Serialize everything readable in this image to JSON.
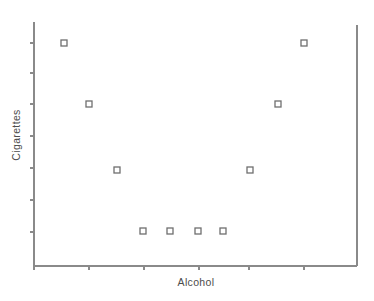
{
  "chart_data": {
    "type": "scatter",
    "title": "",
    "xlabel": "Alcohol",
    "ylabel": "Cigarettes",
    "grid": false,
    "legend": null,
    "xlim": [
      0,
      7
    ],
    "ylim": [
      0,
      7
    ],
    "x_tick_labels": [
      "",
      "",
      "",
      "",
      "",
      ""
    ],
    "y_tick_labels": [
      "",
      "",
      "",
      "",
      "",
      "",
      ""
    ],
    "x_tick_positions": [
      34,
      89,
      144,
      199,
      249,
      304
    ],
    "y_tick_positions": [
      43,
      73,
      104,
      136,
      168,
      200,
      232
    ],
    "marker": "open-square",
    "marker_size": 6,
    "marker_color": "#6f6f6f",
    "axis_color": "#8a8a8a",
    "text_color": "#4c4c4c",
    "points": [
      {
        "label": "p1",
        "px": 64,
        "py": 43
      },
      {
        "label": "p2",
        "px": 89,
        "py": 104
      },
      {
        "label": "p3",
        "px": 117,
        "py": 170
      },
      {
        "label": "p4",
        "px": 143,
        "py": 231
      },
      {
        "label": "p5",
        "px": 170,
        "py": 231
      },
      {
        "label": "p6",
        "px": 198,
        "py": 231
      },
      {
        "label": "p7",
        "px": 223,
        "py": 231
      },
      {
        "label": "p8",
        "px": 250,
        "py": 170
      },
      {
        "label": "p9",
        "px": 278,
        "py": 104
      },
      {
        "label": "p10",
        "px": 304,
        "py": 43
      }
    ],
    "x": [
      1.1,
      1.6,
      2.1,
      2.6,
      3.1,
      3.6,
      4.1,
      4.6,
      5.1,
      5.6
    ],
    "values": [
      6.6,
      5.2,
      3.7,
      2.3,
      2.3,
      2.3,
      2.3,
      3.7,
      5.2,
      6.6
    ]
  },
  "axes": {
    "plot_left": 34,
    "plot_right": 357,
    "plot_top": 22,
    "plot_bottom": 266
  },
  "labels": {
    "y_axis_title": "Cigarettes",
    "x_axis_title": "Alcohol"
  }
}
